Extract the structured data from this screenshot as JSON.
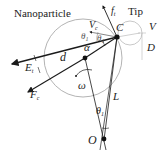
{
  "diagram": {
    "labels": {
      "nanoparticle": "Nanoparticle",
      "tip": "Tip",
      "ft_main": "f",
      "ft_sub": "t",
      "vc_main": "V",
      "vc_sub": "c",
      "theta1_a_main": "θ",
      "theta1_a_sub": "1",
      "theta1_b_main": "θ",
      "theta1_b_sub": "1",
      "c_point": "C",
      "v_right": "V",
      "d_right": "D",
      "d_distance": "d",
      "alpha": "α",
      "e_main": "E",
      "e_sub": "t",
      "fc_main": "F",
      "fc_sub": "c",
      "omega": "ω",
      "l_length": "L",
      "theta1_c_main": "θ",
      "theta1_c_sub": "1",
      "o_point": "O"
    },
    "colors": {
      "line": "#1a1a1a",
      "circle": "#9a9a9a",
      "dim": "#b0b0b0"
    }
  }
}
